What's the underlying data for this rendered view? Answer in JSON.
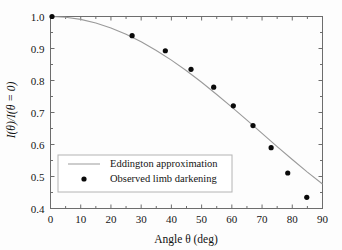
{
  "chart_data": {
    "type": "scatter",
    "title": "",
    "subtitle": "",
    "xlabel": "Angle θ (deg)",
    "ylabel": "I(θ)/I(θ = 0)",
    "xlim": [
      0,
      90
    ],
    "ylim": [
      0.4,
      1.0
    ],
    "grid": false,
    "legend_position": "lower-left-inside",
    "xticks": [
      0,
      10,
      20,
      30,
      40,
      50,
      60,
      70,
      80,
      90
    ],
    "xtick_labels": [
      "0",
      "10",
      "20",
      "30",
      "40",
      "50",
      "60",
      "70",
      "80",
      "90"
    ],
    "yticks": [
      0.4,
      0.5,
      0.6,
      0.7,
      0.8,
      0.9,
      1.0
    ],
    "ytick_labels": [
      "0.4",
      "0.5",
      "0.6",
      "0.7",
      "0.8",
      "0.9",
      "1.0"
    ],
    "series": [
      {
        "name": "Eddington approximation",
        "type": "line",
        "marker": "none",
        "color": "#9a9a9a",
        "x": [
          0,
          5,
          10,
          15,
          20,
          25,
          30,
          35,
          40,
          45,
          50,
          55,
          60,
          65,
          70,
          75,
          80,
          85,
          90
        ],
        "y": [
          1.0,
          0.9977,
          0.9909,
          0.9797,
          0.9642,
          0.9446,
          0.9211,
          0.894,
          0.8636,
          0.8303,
          0.7944,
          0.7564,
          0.7168,
          0.6761,
          0.6348,
          0.5936,
          0.553,
          0.5138,
          0.4767
        ]
      },
      {
        "name": "Observed limb darkening",
        "type": "scatter",
        "marker": "circle",
        "color": "#0a0a0a",
        "x": [
          0.5,
          27.0,
          38.0,
          46.5,
          54.0,
          60.5,
          67.0,
          73.0,
          78.5,
          84.8
        ],
        "y": [
          1.0,
          0.94,
          0.893,
          0.835,
          0.779,
          0.721,
          0.659,
          0.59,
          0.511,
          0.435
        ]
      }
    ]
  },
  "legend": {
    "entries": [
      {
        "label": "Eddington approximation",
        "marker": "line"
      },
      {
        "label": "Observed limb darkening",
        "marker": "dot"
      }
    ]
  },
  "colors": {
    "curve": "#9a9a9a",
    "points": "#0a0a0a",
    "axis": "#6d6d6d",
    "text": "#111111",
    "background": "#fdfdfd"
  }
}
